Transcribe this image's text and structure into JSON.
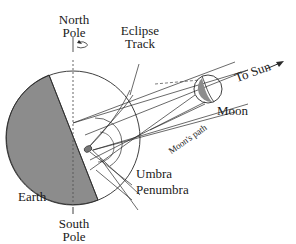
{
  "labels": {
    "north_pole_line1": "North",
    "north_pole_line2": "Pole",
    "eclipse_track_line1": "Eclipse",
    "eclipse_track_line2": "Track",
    "to_sun": "To Sun",
    "moon": "Moon",
    "moons_path": "Moon's path",
    "umbra": "Umbra",
    "penumbra": "Penumbra",
    "earth": "Earth",
    "south_pole_line1": "South",
    "south_pole_line2": "Pole"
  },
  "colors": {
    "night_shade": "#8c8c8c",
    "line": "#2a2a2a",
    "background": "#ffffff"
  }
}
